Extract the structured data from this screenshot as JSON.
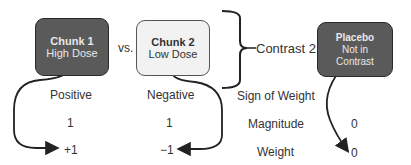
{
  "chunk1": {
    "title": "Chunk 1",
    "subtitle": "High Dose"
  },
  "vs": "vs.",
  "chunk2": {
    "title": "Chunk 2",
    "subtitle": "Low Dose"
  },
  "contrast_label": "Contrast 2",
  "placebo": {
    "title": "Placebo",
    "line1": "Not in",
    "line2": "Contrast"
  },
  "rows": {
    "sign": {
      "label": "Sign of Weight",
      "chunk1": "Positive",
      "chunk2": "Negative"
    },
    "magnitude": {
      "label": "Magnitude",
      "chunk1": "1",
      "chunk2": "1",
      "placebo": "0"
    },
    "weight": {
      "label": "Weight",
      "chunk1": "+1",
      "chunk2": "−1",
      "placebo": "0"
    }
  },
  "colors": {
    "dark_box": "#5a5a5a",
    "light_box": "#f2f2f2",
    "line": "#222222"
  }
}
